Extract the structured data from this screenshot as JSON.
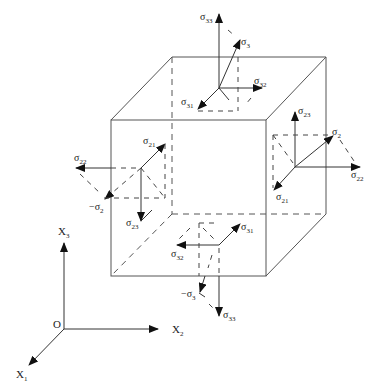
{
  "figure": {
    "type": "stress-cube-diagram"
  },
  "labels": {
    "top_face": {
      "s33": {
        "sym": "σ",
        "sub": "33"
      },
      "s3": {
        "sym": "σ",
        "sub": "3"
      },
      "s32": {
        "sym": "σ",
        "sub": "32"
      },
      "s31": {
        "sym": "σ",
        "sub": "31"
      }
    },
    "right_face": {
      "s23": {
        "sym": "σ",
        "sub": "23"
      },
      "s2": {
        "sym": "σ",
        "sub": "2"
      },
      "s22": {
        "sym": "σ",
        "sub": "22"
      },
      "s21": {
        "sym": "σ",
        "sub": "21"
      }
    },
    "left_face": {
      "s21": {
        "sym": "σ",
        "sub": "21"
      },
      "s22": {
        "sym": "σ",
        "sub": "22"
      },
      "neg_s2": {
        "sym": "−σ",
        "sub": "2"
      },
      "s23": {
        "sym": "σ",
        "sub": "23"
      }
    },
    "bottom_face": {
      "s31": {
        "sym": "σ",
        "sub": "31"
      },
      "s32": {
        "sym": "σ",
        "sub": "32"
      },
      "neg_s3": {
        "sym": "−σ",
        "sub": "3"
      },
      "s33": {
        "sym": "σ",
        "sub": "33"
      }
    }
  },
  "axes": {
    "origin": "O",
    "x1": {
      "sym": "X",
      "sub": "1"
    },
    "x2": {
      "sym": "X",
      "sub": "2"
    },
    "x3": {
      "sym": "X",
      "sub": "3"
    }
  }
}
